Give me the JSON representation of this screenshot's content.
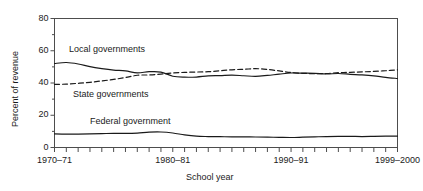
{
  "chart_data": {
    "type": "line",
    "title": "",
    "xlabel": "School year",
    "ylabel": "Percent of revenue",
    "ylim": [
      0,
      80
    ],
    "yticks": [
      "0",
      "20",
      "40",
      "60",
      "80"
    ],
    "ytick_values": [
      0,
      20,
      40,
      60,
      80
    ],
    "y_minor_ticks": [
      10,
      30,
      50,
      70
    ],
    "xtick_labels": [
      "1970–71",
      "1980–81",
      "1990–91",
      "1999–2000"
    ],
    "xtick_label_positions": [
      0,
      10,
      20,
      29
    ],
    "x_start_year_index": 0,
    "x_end_year_index": 29,
    "x_tick_count": 30,
    "grid": false,
    "legend": "inline-annotations",
    "x": [
      "1970-71",
      "1971-72",
      "1972-73",
      "1973-74",
      "1974-75",
      "1975-76",
      "1976-77",
      "1977-78",
      "1978-79",
      "1979-80",
      "1980-81",
      "1981-82",
      "1982-83",
      "1983-84",
      "1984-85",
      "1985-86",
      "1986-87",
      "1987-88",
      "1988-89",
      "1989-90",
      "1990-91",
      "1991-92",
      "1992-93",
      "1993-94",
      "1994-95",
      "1995-96",
      "1996-97",
      "1997-98",
      "1998-99",
      "1999-2000"
    ],
    "series": [
      {
        "name": "Local governments",
        "style": "solid",
        "color": "#1a1a1a",
        "values": [
          52.1,
          52.7,
          51.8,
          50.1,
          48.9,
          48.0,
          47.5,
          46.3,
          47.0,
          46.8,
          44.2,
          43.6,
          43.7,
          44.4,
          44.6,
          44.9,
          44.5,
          44.1,
          44.7,
          45.5,
          46.2,
          46.1,
          46.0,
          45.6,
          45.9,
          45.4,
          45.0,
          44.4,
          43.5,
          42.8
        ]
      },
      {
        "name": "State governments",
        "style": "dashed",
        "color": "#1a1a1a",
        "values": [
          39.1,
          39.3,
          39.8,
          40.4,
          41.3,
          42.2,
          43.4,
          44.8,
          45.0,
          45.5,
          46.2,
          46.6,
          46.8,
          47.0,
          47.6,
          48.2,
          48.5,
          48.9,
          48.4,
          47.5,
          46.5,
          46.0,
          45.8,
          45.9,
          46.4,
          46.6,
          46.9,
          47.2,
          47.6,
          48.2
        ]
      },
      {
        "name": "Federal government",
        "style": "solid",
        "color": "#1a1a1a",
        "values": [
          8.4,
          8.3,
          8.3,
          8.4,
          8.6,
          8.8,
          8.7,
          8.9,
          9.5,
          9.6,
          9.0,
          7.8,
          7.0,
          6.8,
          6.7,
          6.6,
          6.6,
          6.5,
          6.4,
          6.3,
          6.2,
          6.4,
          6.6,
          6.8,
          6.9,
          6.9,
          6.8,
          6.9,
          7.0,
          7.0
        ]
      }
    ],
    "annotations": [
      {
        "text": "Local governments",
        "x_px": 69,
        "y_px": 44
      },
      {
        "text": "State governments",
        "x_px": 73,
        "y_px": 89
      },
      {
        "text": "Federal government",
        "x_px": 90,
        "y_px": 116
      }
    ]
  },
  "colors": {
    "axis": "#4d4d4d",
    "line": "#1a1a1a",
    "background": "#ffffff"
  }
}
